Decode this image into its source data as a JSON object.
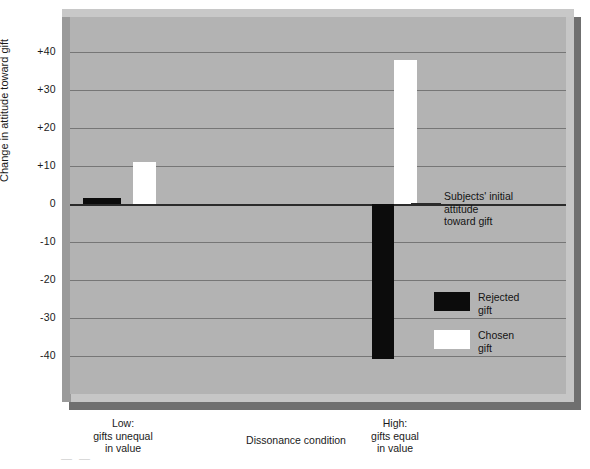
{
  "chart_data": {
    "type": "bar",
    "title": "",
    "xlabel": "Dissonance condition",
    "ylabel": "Change in attitude toward gift",
    "categories": [
      "Low:\ngifts unequal\nin value",
      "High:\ngifts equal\nin value"
    ],
    "category_lines": [
      [
        "Low:",
        "gifts unequal",
        "in value"
      ],
      [
        "High:",
        "gifts equal",
        "in value"
      ]
    ],
    "series": [
      {
        "name": "Rejected gift",
        "color": "#0c0c0c",
        "values": [
          1.5,
          -41
        ]
      },
      {
        "name": "Chosen gift",
        "color": "#ffffff",
        "values": [
          11,
          38
        ]
      }
    ],
    "ylim": [
      -45,
      45
    ],
    "yticks": [
      40,
      30,
      20,
      10,
      0,
      -10,
      -20,
      -30,
      -40
    ],
    "ytick_labels": [
      "+40",
      "+30",
      "+20",
      "+10",
      "0",
      "-10",
      "-20",
      "-30",
      "-40"
    ],
    "grid": true,
    "legend_position": "inside-right",
    "annotations": [
      {
        "name": "zero-reference",
        "lines": [
          "Subjects' initial",
          "attitude",
          "toward gift"
        ],
        "value": 0
      }
    ]
  },
  "legend": {
    "items": [
      {
        "label_line1": "Rejected",
        "label_line2": "gift",
        "color": "#0c0c0c"
      },
      {
        "label_line1": "Chosen",
        "label_line2": "gift",
        "color": "#ffffff"
      }
    ]
  },
  "annotation": {
    "line1": "Subjects' initial",
    "line2": "attitude",
    "line3": "toward gift"
  },
  "axes": {
    "y_label": "Change in attitude toward gift",
    "x_title": "Dissonance condition",
    "y_ticks": [
      "+40",
      "+30",
      "+20",
      "+10",
      "0",
      "-10",
      "-20",
      "-30",
      "-40"
    ],
    "x_categories": [
      {
        "line1": "Low:",
        "line2": "gifts unequal",
        "line3": "in value"
      },
      {
        "line1": "High:",
        "line2": "gifts equal",
        "line3": "in value"
      }
    ]
  },
  "colors": {
    "plot_background": "#b3b3b3",
    "frame_shadow": "#6f6f6f",
    "frame_light": "#c6c6c6",
    "gridline": "#767676",
    "zero_line": "#2b2b2b",
    "rejected": "#0c0c0c",
    "chosen": "#ffffff"
  },
  "caption_artifact": "— —"
}
